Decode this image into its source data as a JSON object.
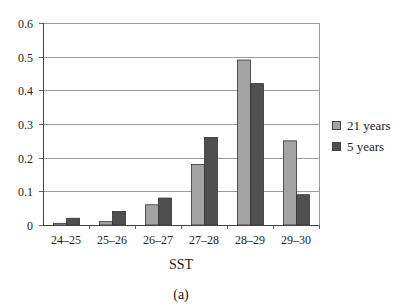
{
  "chart_data": {
    "type": "bar",
    "title": "",
    "xlabel": "SST",
    "ylabel": "",
    "caption": "(a)",
    "categories": [
      "24–25",
      "25–26",
      "26–27",
      "27–28",
      "28–29",
      "29–30"
    ],
    "series": [
      {
        "name": "21 years",
        "color": "#a3a3a3",
        "values": [
          0.005,
          0.01,
          0.06,
          0.18,
          0.49,
          0.25
        ]
      },
      {
        "name": "5 years",
        "color": "#4f4f4f",
        "values": [
          0.02,
          0.04,
          0.08,
          0.26,
          0.42,
          0.09
        ]
      }
    ],
    "ylim": [
      0,
      0.6
    ],
    "yticks": [
      "0",
      "0.1",
      "0.2",
      "0.3",
      "0.4",
      "0.5",
      "0.6"
    ],
    "grid": true,
    "legend_position": "right"
  },
  "legend": {
    "items": [
      {
        "label": "21 years",
        "color": "#a3a3a3"
      },
      {
        "label": "5 years",
        "color": "#4f4f4f"
      }
    ]
  },
  "labels": {
    "xlabel": "SST",
    "caption": "(a)"
  }
}
